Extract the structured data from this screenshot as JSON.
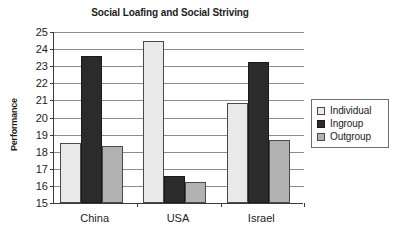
{
  "chart_data": {
    "type": "bar",
    "title": "Social Loafing and Social Striving",
    "xlabel": "",
    "ylabel": "Performance",
    "categories": [
      "China",
      "USA",
      "Israel"
    ],
    "series": [
      {
        "name": "Individual",
        "color": "#e9e9e9",
        "values": [
          18.5,
          24.5,
          20.85
        ]
      },
      {
        "name": "Ingroup",
        "color": "#2b2b2b",
        "values": [
          23.6,
          16.6,
          23.25
        ]
      },
      {
        "name": "Outgroup",
        "color": "#b2b2b2",
        "values": [
          18.35,
          16.2,
          18.7
        ]
      }
    ],
    "ylim": [
      15,
      25
    ],
    "ytick_step": 1,
    "ytick_labels": [
      "25",
      "24",
      "23",
      "22",
      "21",
      "20",
      "19",
      "18",
      "17",
      "16",
      "15"
    ],
    "grid": true,
    "grid_axis": "y",
    "legend_position": "right"
  },
  "legend": {
    "items": [
      {
        "label": "Individual",
        "swatch": "individual"
      },
      {
        "label": "Ingroup",
        "swatch": "ingroup"
      },
      {
        "label": "Outgroup",
        "swatch": "outgroup"
      }
    ]
  }
}
